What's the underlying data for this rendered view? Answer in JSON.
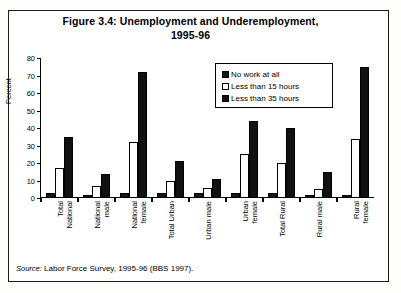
{
  "figure": {
    "title": "Figure 3.4: Unemployment and Underemployment, 1995-96",
    "title_line1": "Figure 3.4: Unemployment and Underemployment,",
    "title_line2": "1995-96",
    "source_prefix": "Source:",
    "source_text": "Labor Force Survey, 1995-96 (BBS 1997)."
  },
  "chart_data": {
    "type": "bar",
    "title": "Figure 3.4: Unemployment and Underemployment, 1995-96",
    "xlabel": "",
    "ylabel": "Percent",
    "ylim": [
      0,
      80
    ],
    "yticks": [
      0,
      10,
      20,
      30,
      40,
      50,
      60,
      70,
      80
    ],
    "grid": false,
    "legend_position": "inside-top-right",
    "categories": [
      "Total National",
      "National male",
      "National female",
      "Total Urban",
      "Urban male",
      "Urban female",
      "Total Rural",
      "Rural male",
      "Rural female"
    ],
    "category_lines": [
      [
        "Total",
        "National"
      ],
      [
        "National",
        "male"
      ],
      [
        "National",
        "female"
      ],
      [
        "Total Urban",
        ""
      ],
      [
        "Urban male",
        ""
      ],
      [
        "Urban",
        "female"
      ],
      [
        "Total Rural",
        ""
      ],
      [
        "Rural male",
        ""
      ],
      [
        "Rural",
        "female"
      ]
    ],
    "series": [
      {
        "name": "No work at all",
        "color": "#171717",
        "values": [
          3,
          2,
          3,
          3,
          3,
          3,
          3,
          2,
          2
        ]
      },
      {
        "name": "Less than 15 hours",
        "color": "#ffffff",
        "values": [
          17,
          7,
          32,
          10,
          6,
          25,
          20,
          5,
          34
        ]
      },
      {
        "name": "Less than 35 hours",
        "color": "#111111",
        "values": [
          35,
          14,
          72,
          21,
          11,
          44,
          40,
          15,
          75
        ]
      }
    ]
  }
}
